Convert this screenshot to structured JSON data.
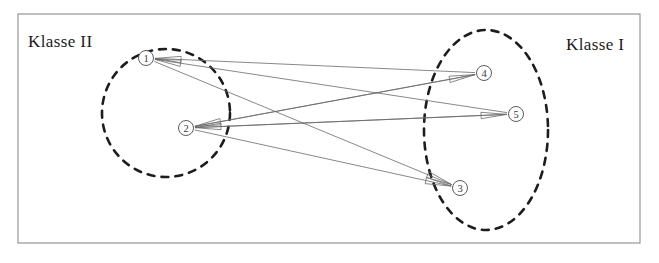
{
  "figure": {
    "background_color": "#ffffff",
    "frame": {
      "x": 18,
      "y": 14,
      "width": 622,
      "height": 229,
      "stroke_color": "#8c8c8c"
    }
  },
  "labels": {
    "left_class": "Klasse II",
    "right_class": "Klasse I"
  },
  "label_positions": {
    "left_class": {
      "x": 28,
      "y": 47
    },
    "right_class": {
      "x": 566,
      "y": 50
    }
  },
  "groups": [
    {
      "id": "klasse-ii",
      "label": "Klasse II",
      "shape": "circle",
      "cx": 166,
      "cy": 113,
      "rx": 64,
      "ry": 64,
      "stroke_color": "#1d1d1d",
      "stroke_style": "dashed"
    },
    {
      "id": "klasse-i",
      "label": "Klasse I",
      "shape": "ellipse",
      "cx": 486,
      "cy": 130,
      "rx": 62,
      "ry": 100,
      "stroke_color": "#1d1d1d",
      "stroke_style": "dashed"
    }
  ],
  "nodes": [
    {
      "id": "n1",
      "glyph": "①",
      "number": "1",
      "group": "klasse-ii",
      "cx": 146,
      "cy": 58,
      "r": 7.5
    },
    {
      "id": "n2",
      "glyph": "②",
      "number": "2",
      "group": "klasse-ii",
      "cx": 186,
      "cy": 128,
      "r": 7.5
    },
    {
      "id": "n3",
      "glyph": "③",
      "number": "3",
      "group": "klasse-i",
      "cx": 460,
      "cy": 188,
      "r": 7.5
    },
    {
      "id": "n4",
      "glyph": "④",
      "number": "4",
      "group": "klasse-i",
      "cx": 484,
      "cy": 73,
      "r": 7.5
    },
    {
      "id": "n5",
      "glyph": "⑤",
      "number": "5",
      "group": "klasse-i",
      "cx": 516,
      "cy": 114,
      "r": 7.5
    }
  ],
  "edges": [
    {
      "id": "e1",
      "from": "n4",
      "to": "n1",
      "arrow_at": "n1"
    },
    {
      "id": "e2",
      "from": "n5",
      "to": "n1",
      "arrow_at": "n1"
    },
    {
      "id": "e3",
      "from": "n1",
      "to": "n3",
      "arrow_at": "n3"
    },
    {
      "id": "e4",
      "from": "n2",
      "to": "n4",
      "arrow_at": "n4"
    },
    {
      "id": "e5",
      "from": "n2",
      "to": "n5",
      "arrow_at": "n5"
    },
    {
      "id": "e6",
      "from": "n2",
      "to": "n3",
      "arrow_at": "n3"
    },
    {
      "id": "e7",
      "from": "n4",
      "to": "n2",
      "arrow_at": "n2"
    },
    {
      "id": "e8",
      "from": "n5",
      "to": "n2",
      "arrow_at": "n2"
    }
  ],
  "style": {
    "edge_color": "#6a6a6a",
    "node_stroke_color": "#4a4a4a",
    "text_color": "#1b1b1b"
  }
}
